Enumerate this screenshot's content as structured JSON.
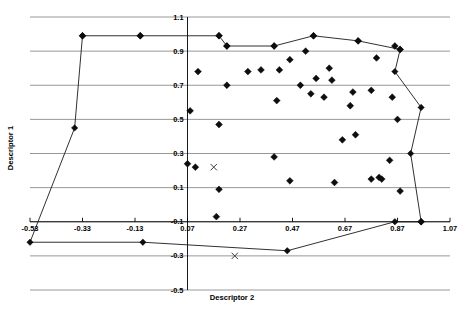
{
  "chart_data": {
    "type": "scatter",
    "title": "",
    "xlabel": "Descriptor 2",
    "ylabel": "Descriptor 1",
    "xlim": [
      -0.53,
      1.07
    ],
    "ylim": [
      -0.5,
      1.1
    ],
    "xticks": [
      "-0.53",
      "-0.33",
      "-0.13",
      "0.07",
      "0.27",
      "0.47",
      "0.67",
      "0.87",
      "1.07"
    ],
    "xtick_values": [
      -0.53,
      -0.33,
      -0.13,
      0.07,
      0.27,
      0.47,
      0.67,
      0.87,
      1.07
    ],
    "yticks": [
      "1.1",
      "0.9",
      "0.7",
      "0.5",
      "0.3",
      "0.1",
      "-0.1",
      "-0.3",
      "-0.5"
    ],
    "ytick_values": [
      1.1,
      0.9,
      0.7,
      0.5,
      0.3,
      0.1,
      -0.1,
      -0.3,
      -0.5
    ],
    "grid": true,
    "grid_axis": "y",
    "legend": "none",
    "series": [
      {
        "name": "samples",
        "marker": "diamond",
        "points": [
          [
            -0.33,
            0.99
          ],
          [
            -0.11,
            0.99
          ],
          [
            0.19,
            0.99
          ],
          [
            0.22,
            0.93
          ],
          [
            0.4,
            0.93
          ],
          [
            0.55,
            0.99
          ],
          [
            0.72,
            0.96
          ],
          [
            0.86,
            0.93
          ],
          [
            0.88,
            0.91
          ],
          [
            0.11,
            0.78
          ],
          [
            0.3,
            0.78
          ],
          [
            0.46,
            0.85
          ],
          [
            0.52,
            0.9
          ],
          [
            0.61,
            0.8
          ],
          [
            0.79,
            0.86
          ],
          [
            0.22,
            0.7
          ],
          [
            0.35,
            0.79
          ],
          [
            0.42,
            0.79
          ],
          [
            0.56,
            0.74
          ],
          [
            0.62,
            0.73
          ],
          [
            0.5,
            0.7
          ],
          [
            0.54,
            0.65
          ],
          [
            0.59,
            0.63
          ],
          [
            0.41,
            0.61
          ],
          [
            0.7,
            0.66
          ],
          [
            0.77,
            0.67
          ],
          [
            0.85,
            0.63
          ],
          [
            0.08,
            0.55
          ],
          [
            0.19,
            0.47
          ],
          [
            0.69,
            0.58
          ],
          [
            0.66,
            0.38
          ],
          [
            0.71,
            0.41
          ],
          [
            0.87,
            0.5
          ],
          [
            0.07,
            0.24
          ],
          [
            0.4,
            0.28
          ],
          [
            0.84,
            0.26
          ],
          [
            0.63,
            0.13
          ],
          [
            0.8,
            0.16
          ],
          [
            0.81,
            0.15
          ],
          [
            0.46,
            0.14
          ],
          [
            0.19,
            0.09
          ],
          [
            0.88,
            0.08
          ],
          [
            0.18,
            -0.07
          ],
          [
            0.96,
            -0.1
          ],
          [
            0.1,
            0.22
          ],
          [
            0.77,
            0.15
          ]
        ]
      },
      {
        "name": "outliers",
        "marker": "x",
        "points": [
          [
            0.17,
            0.22
          ],
          [
            0.25,
            -0.3
          ]
        ]
      }
    ],
    "hull": {
      "name": "convex-hull",
      "closed": true,
      "vertices": [
        [
          -0.33,
          0.99
        ],
        [
          -0.11,
          0.99
        ],
        [
          0.19,
          0.99
        ],
        [
          0.22,
          0.93
        ],
        [
          0.4,
          0.93
        ],
        [
          0.55,
          0.99
        ],
        [
          0.72,
          0.96
        ],
        [
          0.88,
          0.91
        ],
        [
          0.86,
          0.78
        ],
        [
          0.96,
          0.57
        ],
        [
          0.92,
          0.3
        ],
        [
          0.96,
          -0.1
        ],
        [
          0.86,
          -0.1
        ],
        [
          0.45,
          -0.27
        ],
        [
          -0.1,
          -0.22
        ],
        [
          -0.53,
          -0.22
        ],
        [
          -0.36,
          0.45
        ]
      ]
    }
  },
  "axes": {
    "x_title": "Descriptor 2",
    "y_title": "Descriptor 1"
  }
}
